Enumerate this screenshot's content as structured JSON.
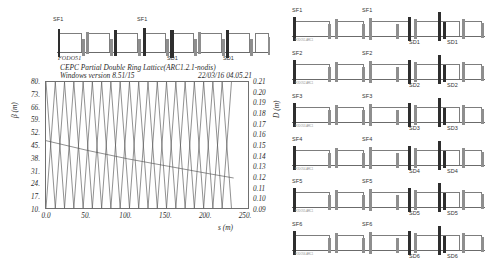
{
  "document": {
    "title_line1": "CEPC Partial Double Ring Lattice(ARC1.2.1-nodis)",
    "title_line2": "Windows version 8.51/15",
    "timestamp": "22/03/16  04.05.21"
  },
  "left_panel": {
    "lattice": {
      "name": "top-lattice-diagram",
      "cell_label": "FODO51",
      "markers": [
        {
          "text": "SF1",
          "x": 18,
          "pos": "top"
        },
        {
          "text": "SF1",
          "x": 118,
          "pos": "top"
        },
        {
          "text": "SD1",
          "x": 133,
          "pos": "bottom"
        },
        {
          "text": "SD1",
          "x": 178,
          "pos": "bottom"
        }
      ]
    },
    "plot": {
      "x_axis": {
        "label": "s (m)",
        "ticks": [
          "0.0",
          "50.",
          "100.",
          "150.",
          "200.",
          "250."
        ],
        "min": 0,
        "max": 250
      },
      "y_axis_left": {
        "label": "β (m)",
        "ticks": [
          "80.",
          "73.",
          "66.",
          "59.",
          "52.",
          "45.",
          "38.",
          "31.",
          "24.",
          "17.",
          "10."
        ],
        "min": 10,
        "max": 80
      },
      "y_axis_right": {
        "label": "D (m)",
        "ticks": [
          "0.21",
          "0.20",
          "0.19",
          "0.18",
          "0.17",
          "0.16",
          "0.15",
          "0.14",
          "0.13",
          "0.12",
          "0.11",
          "0.10",
          "0.09"
        ],
        "min": 0.09,
        "max": 0.21
      }
    }
  },
  "right_panel": {
    "rows": [
      {
        "sf_left": "SF1",
        "sf_mid": "SF1",
        "sd_mid": "SD1",
        "sd_right": "SD1",
        "micro": "FODO51-ARC1"
      },
      {
        "sf_left": "SF2",
        "sf_mid": "SF2",
        "sd_mid": "SD2",
        "sd_right": "SD2",
        "micro": "FODO52-ARC1"
      },
      {
        "sf_left": "SF3",
        "sf_mid": "SF3",
        "sd_mid": "SD3",
        "sd_right": "SD3",
        "micro": "FODO53-ARC1"
      },
      {
        "sf_left": "SF4",
        "sf_mid": "SF4",
        "sd_mid": "SD4",
        "sd_right": "SD4",
        "micro": "FODO54-ARC1"
      },
      {
        "sf_left": "SF5",
        "sf_mid": "SF5",
        "sd_mid": "SD5",
        "sd_right": "SD5",
        "micro": "FODO55-ARC1"
      },
      {
        "sf_left": "SF6",
        "sf_mid": "SF6",
        "sd_mid": "SD6",
        "sd_right": "SD6",
        "micro": "FODO56-ARC1"
      }
    ]
  },
  "chart_data": {
    "type": "line",
    "title": "CEPC Partial Double Ring Lattice(ARC1.2.1-nodis)",
    "subtitle": "Windows version 8.51/15",
    "xlabel": "s (m)",
    "ylabel": "β (m)",
    "y2label": "D (m)",
    "xlim": [
      0,
      250
    ],
    "ylim": [
      10,
      80
    ],
    "y2lim": [
      0.09,
      0.21
    ],
    "xticks": [
      0,
      50,
      100,
      150,
      200,
      250
    ],
    "yticks": [
      10,
      17,
      24,
      31,
      38,
      45,
      52,
      59,
      66,
      73,
      80
    ],
    "y2ticks": [
      0.09,
      0.1,
      0.11,
      0.12,
      0.13,
      0.14,
      0.15,
      0.16,
      0.17,
      0.18,
      0.19,
      0.2,
      0.21
    ],
    "grid": false,
    "legend": "none",
    "period_m": 22.7,
    "n_periods": 11,
    "series": [
      {
        "name": "beta_x",
        "axis": "left",
        "description": "triangular oscillation, minimum 11 m, maximum 80 m, period 22.7 m, first maximum at s=0",
        "x": [
          0,
          11.4,
          22.7,
          34.1,
          45.5,
          56.8,
          68.2,
          79.5,
          90.9,
          102.3,
          113.6,
          125.0,
          136.4,
          147.7,
          159.1,
          170.5,
          181.8,
          193.2,
          204.5,
          215.9,
          227.3
        ],
        "y": [
          80,
          11,
          80,
          11,
          80,
          11,
          80,
          11,
          80,
          11,
          80,
          11,
          80,
          11,
          80,
          11,
          80,
          11,
          80,
          11,
          80
        ]
      },
      {
        "name": "beta_y",
        "axis": "left",
        "description": "triangular oscillation in antiphase to beta_x, minimum 11 m, maximum 80 m, period 22.7 m, first minimum at s=0",
        "x": [
          0,
          11.4,
          22.7,
          34.1,
          45.5,
          56.8,
          68.2,
          79.5,
          90.9,
          102.3,
          113.6,
          125.0,
          136.4,
          147.7,
          159.1,
          170.5,
          181.8,
          193.2,
          204.5,
          215.9,
          227.3
        ],
        "y": [
          11,
          80,
          11,
          80,
          11,
          80,
          11,
          80,
          11,
          80,
          11,
          80,
          11,
          80,
          11,
          80,
          11,
          80,
          11,
          80,
          11
        ]
      },
      {
        "name": "D_x",
        "axis": "right",
        "description": "dispersion, nearly flat slowly decreasing from about 0.155 m to 0.120 m",
        "x": [
          0,
          50,
          100,
          150,
          200,
          230
        ],
        "y": [
          0.155,
          0.146,
          0.138,
          0.131,
          0.124,
          0.12
        ]
      }
    ]
  }
}
